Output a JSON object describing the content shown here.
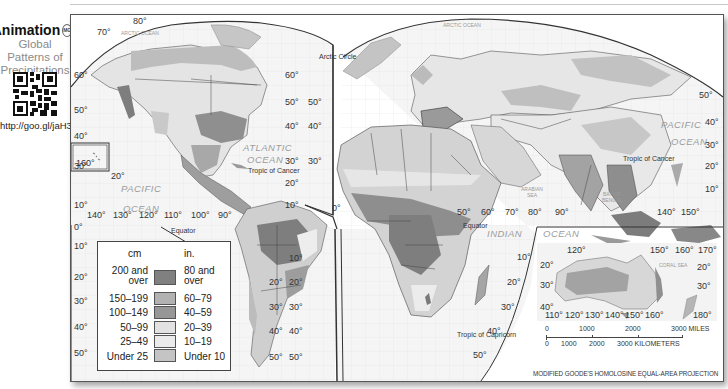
{
  "sidebar": {
    "animation_label": "Animation",
    "badge": "MG",
    "subtitle_lines": [
      "Global",
      "Patterns of",
      "Precipitations"
    ],
    "qr_icon": "qr-code-icon",
    "url": "http://goo.gl/jaH3Zz"
  },
  "map": {
    "title": "Global Patterns of Precipitation",
    "projection_note": "MODIFIED GOODE'S HOMOLOSINE EQUAL-AREA PROJECTION",
    "colors": {
      "ocean": "#f4f4f4",
      "land_light": "#e6e6e6",
      "land_mid": "#c9c9c9",
      "land_dark": "#9a9a9a",
      "land_darkest": "#7c7c7c",
      "border": "#4a4a4a"
    },
    "oceans": {
      "arctic_left": "ARCTIC OCEAN",
      "arctic_right": "ARCTIC OCEAN",
      "atlantic_1": "ATLANTIC",
      "atlantic_2": "OCEAN",
      "pacific_left_1": "PACIFIC",
      "pacific_left_2": "OCEAN",
      "pacific_right_1": "PACIFIC",
      "pacific_right_2": "OCEAN",
      "indian_1": "INDIAN",
      "indian_2": "OCEAN",
      "arabian_sea_1": "ARABIAN",
      "arabian_sea_2": "SEA",
      "bay_bengal_1": "BAY OF",
      "bay_bengal_2": "BENGAL",
      "coral_sea": "CORAL SEA"
    },
    "lines": {
      "arctic_circle": "Arctic Circle",
      "tropic_cancer_left": "Tropic of Cancer",
      "tropic_cancer_right": "Tropic of Cancer",
      "equator_left": "Equator",
      "equator_right": "Equator",
      "tropic_capricorn": "Tropic of Capricorn"
    },
    "lat_labels": {
      "left_edge": [
        "60°",
        "50°",
        "40°",
        "30°",
        "20°",
        "10°",
        "0°",
        "10°",
        "20°",
        "30°",
        "40°",
        "50°"
      ],
      "americas_right": [
        "60°",
        "50°",
        "40°",
        "30°",
        "20°",
        "10°"
      ],
      "eurasia_left": [
        "50°",
        "40°",
        "30°"
      ],
      "s_america_right": [
        "20°",
        "30°",
        "40°",
        "50°"
      ],
      "africa_left": [
        "10°",
        "20°",
        "30°",
        "40°",
        "50°"
      ],
      "africa_right": [
        "10°",
        "20°",
        "30°",
        "40°",
        "50°"
      ],
      "asia_right": [
        "50°",
        "40°",
        "30°",
        "20°",
        "10°"
      ],
      "top_left": [
        "80°",
        "70°"
      ],
      "hawaii_lat": "20°",
      "hawaii_lon": "160°",
      "zero_africa": "0°"
    },
    "lon_labels": {
      "pacific": [
        "140°",
        "130°",
        "120°",
        "110°",
        "100°",
        "90°"
      ],
      "indian": [
        "50°",
        "60°",
        "70°",
        "80°",
        "90°"
      ],
      "asia_pacific": [
        "140°",
        "150°"
      ]
    },
    "legend": {
      "header_cm": "cm",
      "header_in": "in.",
      "rows": [
        {
          "cm": "200 and over",
          "cm_l1": "200 and",
          "cm_l2": "over",
          "in_l1": "80 and",
          "in_l2": "over",
          "in": "80 and over",
          "color": "#808080"
        },
        {
          "cm": "150–199",
          "cm_l1": "150–199",
          "in_l1": "60–79",
          "in": "60–79",
          "color": "#b2b2b2"
        },
        {
          "cm": "100–149",
          "cm_l1": "100–149",
          "in_l1": "40–59",
          "in": "40–59",
          "color": "#979797"
        },
        {
          "cm": "50–99",
          "cm_l1": "50–99",
          "in_l1": "20–39",
          "in": "20–39",
          "color": "#e2e2e2"
        },
        {
          "cm": "25–49",
          "cm_l1": "25–49",
          "in_l1": "10–19",
          "in": "10–19",
          "color": "#e8e8e8"
        },
        {
          "cm": "Under 25",
          "cm_l1": "Under 25",
          "in_l1": "Under 10",
          "in": "Under 10",
          "color": "#c4c4c4"
        }
      ]
    },
    "inset": {
      "top_lons": [
        "120°",
        "150°",
        "160°",
        "170°"
      ],
      "bottom_lons": [
        "110°",
        "120°",
        "130°",
        "140°",
        "150°",
        "160°",
        "180°"
      ],
      "left_lats": [
        "20°",
        "30°",
        "40°"
      ],
      "right_lats": [
        "20°",
        "30°"
      ]
    },
    "scale": {
      "miles": [
        "0",
        "1000",
        "2000",
        "3000 MILES"
      ],
      "km": [
        "0",
        "1000",
        "2000",
        "3000 KILOMETERS"
      ]
    }
  }
}
